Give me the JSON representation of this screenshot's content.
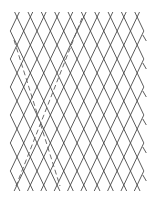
{
  "diagram": {
    "type": "diamond-lattice",
    "background": "#ffffff",
    "line_color": "#4a4a4a",
    "lattice": {
      "origin_x": 17,
      "origin_y": 17,
      "cell_width": 13.35,
      "cell_height": 28,
      "columns": 10,
      "rows": 7,
      "bounds": {
        "x_min": 10.3,
        "x_max": 143.8,
        "y_min": 12,
        "y_max": 191
      }
    },
    "dashed_lines": [
      {
        "x1": 14,
        "y1": 40,
        "x2": 60,
        "y2": 186
      },
      {
        "x1": 82,
        "y1": 18,
        "x2": 16,
        "y2": 186
      }
    ],
    "right_edge_ticks_y": [
      38,
      66,
      94,
      122,
      150,
      178
    ]
  }
}
